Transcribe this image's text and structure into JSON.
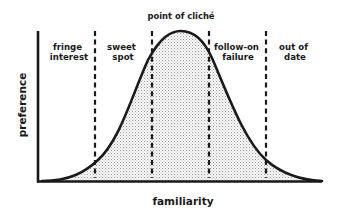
{
  "diagram": {
    "type": "bell-curve-regions",
    "top_label": "point of cliché",
    "x_axis_label": "familiarity",
    "y_axis_label": "preference",
    "regions": [
      {
        "id": "fringe-interest",
        "line1": "fringe",
        "line2": "interest"
      },
      {
        "id": "sweet-spot",
        "line1": "sweet",
        "line2": "spot"
      },
      {
        "id": "follow-on-failure",
        "line1": "follow-on",
        "line2": "failure"
      },
      {
        "id": "out-of-date",
        "line1": "out of",
        "line2": "date"
      }
    ],
    "divider_count": 4,
    "colors": {
      "stroke": "#1a1a1a",
      "fill_dots": "#9a9a9a",
      "background": "#ffffff"
    }
  }
}
